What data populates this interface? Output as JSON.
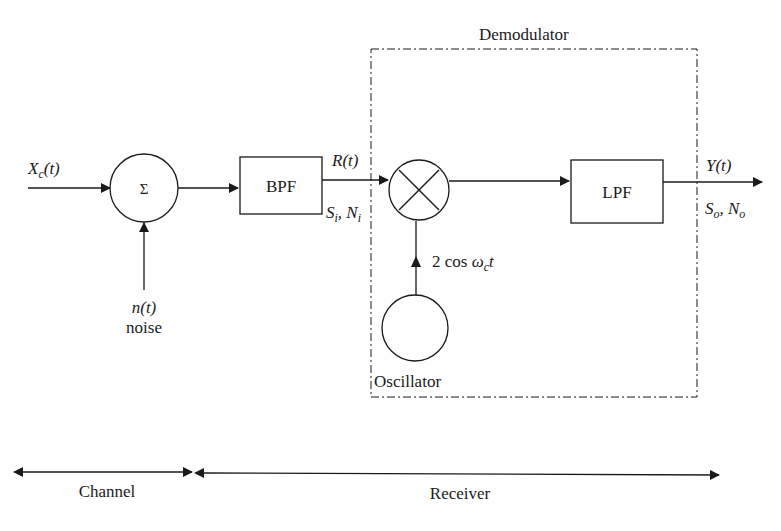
{
  "diagram": {
    "demodulator_label": "Demodulator",
    "input": {
      "base": "X",
      "sub": "c",
      "arg": "(t)"
    },
    "summer_symbol": "Σ",
    "noise": {
      "signal": "n(t)",
      "label": "noise"
    },
    "bpf_label": "BPF",
    "bpf_output": {
      "signal": "R(t)",
      "s": "S",
      "s_sub": "i",
      "n": "N",
      "n_sub": "i"
    },
    "oscillator_label": "Oscillator",
    "osc_signal": {
      "prefix": "2 cos ",
      "omega": "ω",
      "sub": "c",
      "t": "t"
    },
    "lpf_label": "LPF",
    "output": {
      "signal": "Y(t)",
      "s": "S",
      "s_sub": "o",
      "n": "N",
      "n_sub": "o"
    },
    "ranges": {
      "channel": "Channel",
      "receiver": "Receiver"
    },
    "colors": {
      "stroke": "#1a1a1a",
      "background": "#ffffff"
    }
  }
}
